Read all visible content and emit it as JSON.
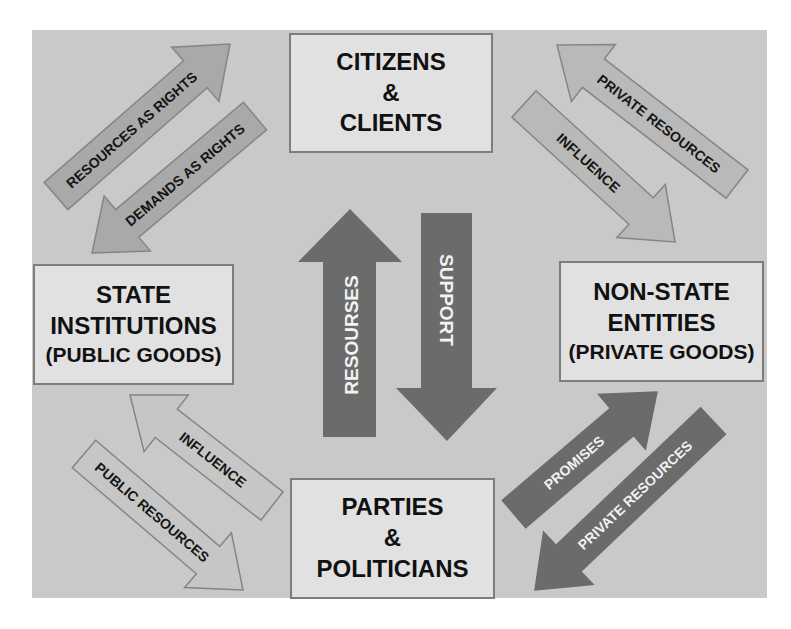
{
  "diagram": {
    "colors": {
      "background": "#c9c9c9",
      "page": "#ffffff",
      "box_fill": "#e1e1e1",
      "box_border": "#7d7d7d",
      "dark_arrow": "#6b6b6b",
      "medium_arrow": "#a9a9a9",
      "light_arrow": "#b9b9b9",
      "outline_arrow": "#c6c6c6",
      "arrow_outline": "#858585",
      "dark_text": "#151515",
      "light_text": "#f2f2f2"
    },
    "nodes": {
      "citizens": {
        "line1": "CITIZENS",
        "line2": "&",
        "line3": "CLIENTS"
      },
      "state": {
        "line1": "STATE",
        "line2": "INSTITUTIONS",
        "line3": "(PUBLIC GOODS)"
      },
      "nonstate": {
        "line1": "NON-STATE",
        "line2": "ENTITIES",
        "line3": "(PRIVATE GOODS)"
      },
      "parties": {
        "line1": "PARTIES",
        "line2": "&",
        "line3": "POLITICIANS"
      }
    },
    "arrows": [
      {
        "id": "resources-as-rights",
        "label": "RESOURCES AS RIGHTS",
        "from": "state",
        "to": "citizens",
        "tail": [
          56,
          196
        ],
        "tip": [
          230,
          44
        ],
        "style": "medium"
      },
      {
        "id": "demands-as-rights",
        "label": "DEMANDS AS RIGHTS",
        "from": "citizens",
        "to": "state",
        "tail": [
          255,
          116
        ],
        "tip": [
          92,
          253
        ],
        "style": "medium"
      },
      {
        "id": "private-resources-top",
        "label": "PRIVATE RESOURCES",
        "from": "nonstate",
        "to": "citizens",
        "tail": [
          737,
          184
        ],
        "tip": [
          557,
          45
        ],
        "style": "light"
      },
      {
        "id": "influence-top",
        "label": "INFLUENCE",
        "from": "citizens",
        "to": "nonstate",
        "tail": [
          524,
          104
        ],
        "tip": [
          675,
          242
        ],
        "style": "light"
      },
      {
        "id": "influence-bottom",
        "label": "INFLUENCE",
        "from": "parties",
        "to": "state",
        "tail": [
          272,
          506
        ],
        "tip": [
          130,
          395
        ],
        "style": "outline"
      },
      {
        "id": "public-resources",
        "label": "PUBLIC RESOURCES",
        "from": "state",
        "to": "parties",
        "tail": [
          84,
          454
        ],
        "tip": [
          243,
          590
        ],
        "style": "outline"
      },
      {
        "id": "promises",
        "label": "PROMISES",
        "from": "parties",
        "to": "nonstate",
        "tail": [
          514,
          514
        ],
        "tip": [
          657,
          392
        ],
        "style": "dark"
      },
      {
        "id": "private-resources-bottom",
        "label": "PRIVATE RESOURCES",
        "from": "nonstate",
        "to": "parties",
        "tail": [
          713,
          421
        ],
        "tip": [
          535,
          590
        ],
        "style": "dark"
      }
    ],
    "center_arrows": {
      "resources": {
        "label": "RESOURSES",
        "direction": "up",
        "from": "parties",
        "to": "citizens"
      },
      "support": {
        "label": "SUPPORT",
        "direction": "down",
        "from": "citizens",
        "to": "parties"
      }
    }
  }
}
